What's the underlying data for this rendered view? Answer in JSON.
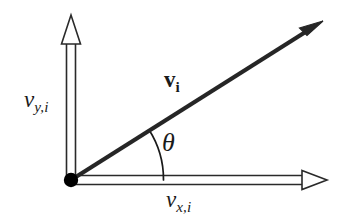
{
  "figure": {
    "background_color": "#ffffff",
    "stroke_color": "#1a1a1a",
    "axis_fill_color": "#ffffff"
  },
  "diagram": {
    "type": "vector-decomposition",
    "origin": {
      "x": 71,
      "y": 180,
      "dot_radius": 7,
      "color": "#000000"
    },
    "axes": [
      {
        "name": "y-axis",
        "style": "hollow-double-line-with-open-arrowhead",
        "from": {
          "x": 71,
          "y": 180
        },
        "to": {
          "x": 71,
          "y": 16
        },
        "label": "v_{y,i}"
      },
      {
        "name": "x-axis",
        "style": "hollow-double-line-with-open-arrowhead",
        "from": {
          "x": 71,
          "y": 180
        },
        "to": {
          "x": 326,
          "y": 180
        },
        "label": "v_{x,i}"
      }
    ],
    "vector": {
      "name": "resultant-velocity-vector",
      "style": "solid-thick-line-with-filled-arrowhead",
      "from": {
        "x": 71,
        "y": 180
      },
      "to": {
        "x": 323,
        "y": 21
      },
      "label": "v_i",
      "label_style": "bold"
    },
    "angle": {
      "name": "theta",
      "symbol": "θ",
      "arc_radius": 92,
      "between": [
        "x-axis",
        "resultant-velocity-vector"
      ],
      "approx_degrees": 32
    }
  },
  "labels": {
    "y_component": {
      "base": "v",
      "subscript": "y,i",
      "full": "v_{y,i}",
      "style": "italic-serif"
    },
    "x_component": {
      "base": "v",
      "subscript": "x,i",
      "full": "v_{x,i}",
      "style": "italic-serif"
    },
    "vector": {
      "base": "v",
      "subscript": "i",
      "full": "v_i",
      "style": "bold-serif"
    },
    "angle": {
      "symbol": "θ",
      "full": "θ",
      "style": "italic-serif"
    }
  }
}
